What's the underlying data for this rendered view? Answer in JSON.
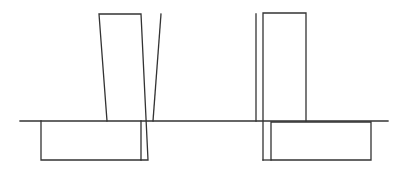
{
  "diagram": {
    "width": 405,
    "height": 170,
    "stroke_color": "#333333",
    "background": "#ffffff",
    "stroke_width": 1.3,
    "ground_line": {
      "x1": 20,
      "y1": 121,
      "x2": 388,
      "y2": 121
    },
    "left_group": {
      "base_box": {
        "points": "41,121 41,160 141,160 141,121"
      },
      "tilted_block": {
        "points": "107,121 99,14 141,14 148,160 141,160"
      },
      "thin_tilted_line": {
        "x1": 161,
        "y1": 14,
        "x2": 153,
        "y2": 121
      }
    },
    "right_group": {
      "thin_vertical_line": {
        "x1": 256,
        "y1": 14,
        "x2": 256,
        "y2": 121
      },
      "upright_block": {
        "points": "263,160 263,13 306,13 306,121"
      },
      "bottom_connector": {
        "x1": 263,
        "y1": 160,
        "x2": 271,
        "y2": 160
      },
      "base_box": {
        "points": "271,160 271,122 371,122 371,160 271,160"
      }
    }
  }
}
